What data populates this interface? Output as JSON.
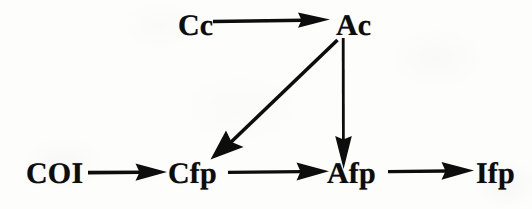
{
  "diagram": {
    "type": "flow-diagram",
    "title": "",
    "background_color": "#fdfdfc",
    "ink_color": "#0d0d0d",
    "nodes": [
      {
        "id": "cc",
        "label": "Cc",
        "x": 178,
        "y": 38,
        "row": "top"
      },
      {
        "id": "ac",
        "label": "Ac",
        "x": 336,
        "y": 38,
        "row": "top"
      },
      {
        "id": "coi",
        "label": "COI",
        "x": 26,
        "y": 186,
        "row": "bottom"
      },
      {
        "id": "cfp",
        "label": "Cfp",
        "x": 168,
        "y": 186,
        "row": "bottom"
      },
      {
        "id": "afp",
        "label": "Afp",
        "x": 327,
        "y": 186,
        "row": "bottom"
      },
      {
        "id": "ifp",
        "label": "Ifp",
        "x": 476,
        "y": 186,
        "row": "bottom"
      }
    ],
    "edges": [
      {
        "id": "cc-to-ac",
        "from": "Cc",
        "to": "Ac",
        "direction": "right",
        "arrowhead": "solid-triangle"
      },
      {
        "id": "ac-to-cfp",
        "from": "Ac",
        "to": "Cfp",
        "direction": "down-left",
        "arrowhead": "solid-triangle"
      },
      {
        "id": "ac-to-afp",
        "from": "Ac",
        "to": "Afp",
        "direction": "down",
        "arrowhead": "solid-triangle"
      },
      {
        "id": "coi-to-cfp",
        "from": "COI",
        "to": "Cfp",
        "direction": "right",
        "arrowhead": "solid-triangle"
      },
      {
        "id": "cfp-to-afp",
        "from": "Cfp",
        "to": "Afp",
        "direction": "right",
        "arrowhead": "solid-triangle"
      },
      {
        "id": "afp-to-ifp",
        "from": "Afp",
        "to": "Ifp",
        "direction": "right",
        "arrowhead": "solid-triangle"
      }
    ]
  }
}
